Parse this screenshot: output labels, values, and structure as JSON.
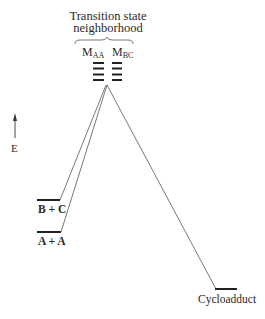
{
  "diagram": {
    "title_line1": "Transition state",
    "title_line2": "neighborhood",
    "ts_labels": {
      "maa_main": "M",
      "maa_sub": "AA",
      "mbc_main": "M",
      "mbc_sub": "BC"
    },
    "energy_axis_label": "E",
    "states": {
      "bc": "B + C",
      "aa": "A + A",
      "product": "Cycloadduct"
    },
    "ts_level_count_per_column": 4,
    "colors": {
      "ink": "#2a2a2a",
      "line": "#555555",
      "background": "#ffffff"
    }
  }
}
